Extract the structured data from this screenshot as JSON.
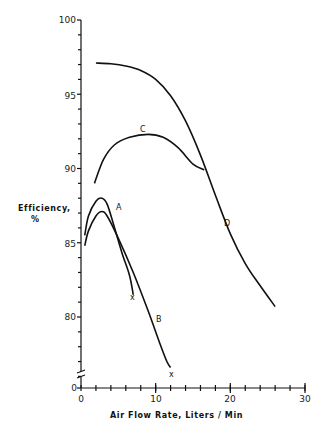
{
  "chart_data": {
    "type": "line",
    "title": "",
    "xlabel": "Air Flow Rate, Liters / Min",
    "ylabel": "Efficiency, %",
    "xlim": [
      0,
      30
    ],
    "ylim": [
      0,
      100
    ],
    "y_axis_break": "between 0 and 75",
    "xticks": [
      0,
      10,
      20,
      30
    ],
    "xticks_minor_step": 2,
    "yticks": [
      0,
      80,
      85,
      90,
      95,
      100
    ],
    "yticks_minor_step": 1,
    "grid": false,
    "legend": "inline curve labels",
    "series": [
      {
        "name": "A",
        "end_marker": "x",
        "x": [
          0.5,
          1.0,
          2.0,
          2.8,
          3.5,
          4.5,
          5.5,
          6.5,
          7.0
        ],
        "y": [
          85.5,
          86.8,
          87.8,
          88.0,
          87.6,
          86.0,
          84.3,
          82.8,
          81.5
        ]
      },
      {
        "name": "B",
        "end_marker": "x",
        "x": [
          0.5,
          1.0,
          2.0,
          2.8,
          3.5,
          5.0,
          7.0,
          9.0,
          10.5,
          11.5,
          12.0
        ],
        "y": [
          84.8,
          85.8,
          86.8,
          87.1,
          86.8,
          85.3,
          83.0,
          80.4,
          78.3,
          77.0,
          76.6
        ]
      },
      {
        "name": "C",
        "x": [
          1.8,
          3.0,
          4.5,
          6.5,
          9.0,
          11.0,
          13.0,
          15.0,
          16.5
        ],
        "y": [
          89.0,
          90.6,
          91.6,
          92.1,
          92.3,
          92.1,
          91.4,
          90.3,
          89.9
        ]
      },
      {
        "name": "D",
        "x": [
          2.0,
          4.0,
          6.0,
          8.0,
          10.0,
          12.0,
          14.0,
          16.0,
          18.0,
          20.0,
          22.0,
          24.0,
          26.0
        ],
        "y": [
          97.1,
          97.05,
          96.9,
          96.6,
          96.0,
          94.9,
          93.2,
          90.9,
          88.2,
          85.6,
          83.6,
          82.1,
          80.7
        ]
      }
    ]
  },
  "labels": {
    "ylabel_line1": "Efficiency,",
    "ylabel_line2": "%",
    "xlabel": "Air Flow Rate, Liters / Min",
    "x0": "0",
    "x10": "10",
    "x20": "20",
    "x30": "30",
    "y0": "0",
    "y80": "80",
    "y85": "85",
    "y90": "90",
    "y95": "95",
    "y100": "100",
    "curve_a": "A",
    "curve_b": "B",
    "curve_c": "C",
    "curve_d": "D",
    "end_mark": "x"
  }
}
